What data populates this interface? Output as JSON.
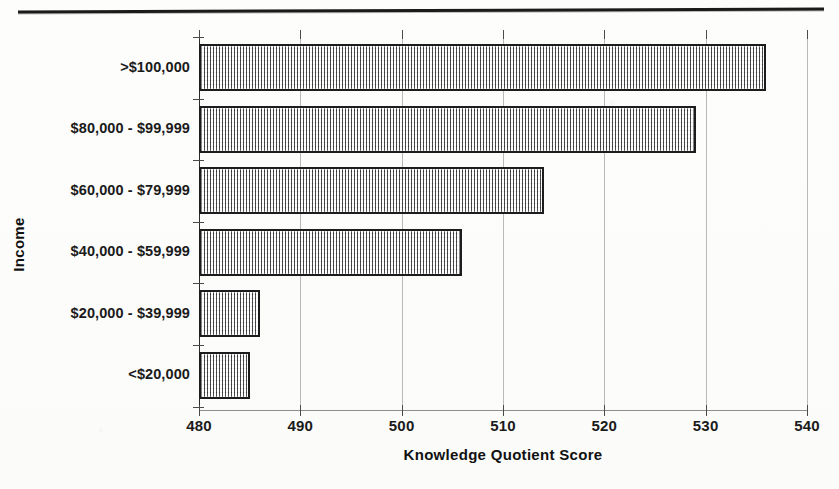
{
  "page": {
    "rule_name": "horizontal-divider-rule"
  },
  "chart_data": {
    "type": "bar",
    "orientation": "horizontal",
    "title": "",
    "xlabel": "Knowledge Quotient Score",
    "ylabel": "Income",
    "categories": [
      "<$20,000",
      "$20,000 - $39,999",
      "$40,000 - $59,999",
      "$60,000 - $79,999",
      "$80,000 - $99,999",
      ">$100,000"
    ],
    "values": [
      485,
      486,
      506,
      514,
      529,
      536
    ],
    "xlim": [
      480,
      540
    ],
    "xticks": [
      480,
      490,
      500,
      510,
      520,
      530,
      540
    ],
    "xtick_labels": [
      "480",
      "490",
      "500",
      "510",
      "520",
      "530",
      "540"
    ],
    "grid": "vertical",
    "legend": "none",
    "bar_fill": "#cfcfcf",
    "bar_edge": "#1c1c1c",
    "gridline_color": "#b9b9b9"
  }
}
